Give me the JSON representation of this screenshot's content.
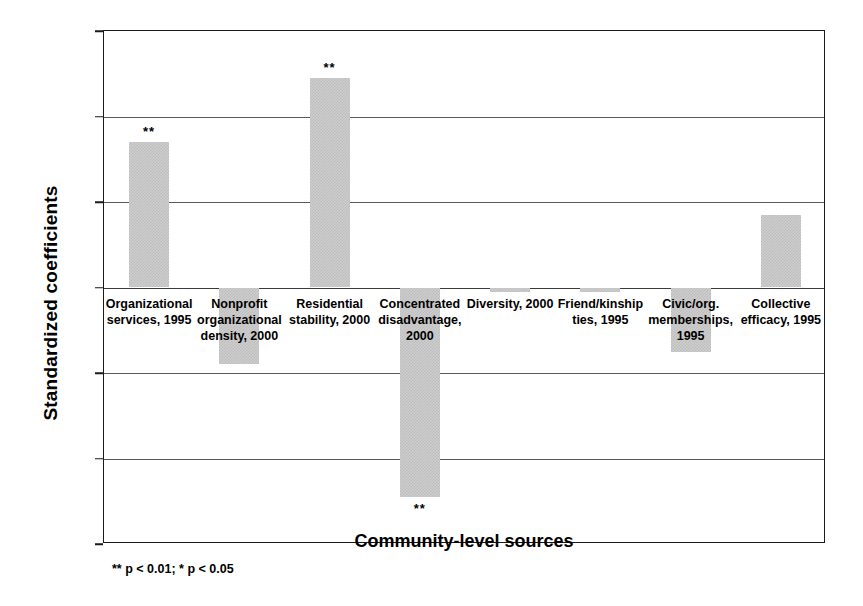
{
  "chart_data": {
    "type": "bar",
    "title": "",
    "xlabel": "Community-level sources",
    "ylabel": "Standardized coefficients",
    "ylim": [
      -0.6,
      0.6
    ],
    "ytick_labels": [
      "0.60",
      "0.40",
      "0.20",
      "0.00",
      "-0.20",
      "-0.40",
      "-0.60"
    ],
    "ytick_values": [
      0.6,
      0.4,
      0.2,
      0.0,
      -0.2,
      -0.4,
      -0.6
    ],
    "grid": true,
    "legend": "none",
    "bar_color": "#cdcdcd",
    "categories": [
      "Organizational services, 1995",
      "Nonprofit organizational density, 2000",
      "Residential stability, 2000",
      "Concentrated disadvantage, 2000",
      "Diversity, 2000",
      "Friend/kinship ties, 1995",
      "Civic/org. memberships, 1995",
      "Collective efficacy, 1995"
    ],
    "values": [
      0.34,
      -0.18,
      0.49,
      -0.49,
      -0.01,
      -0.01,
      -0.15,
      0.17
    ],
    "significance": [
      "**",
      "",
      "**",
      "**",
      "",
      "",
      "",
      ""
    ],
    "annotations": {
      "footnote": "** p < 0.01; * p < 0.05"
    }
  }
}
